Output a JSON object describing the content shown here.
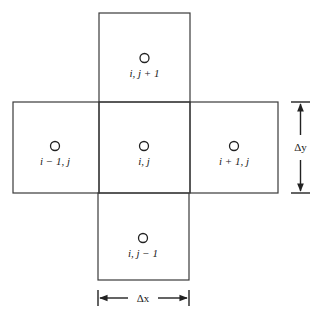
{
  "diagram": {
    "type": "five-point finite-difference stencil",
    "cells": [
      {
        "id": "north",
        "label": "i, j + 1"
      },
      {
        "id": "west",
        "label": "i − 1, j"
      },
      {
        "id": "center",
        "label": "i, j"
      },
      {
        "id": "east",
        "label": "i + 1, j"
      },
      {
        "id": "south",
        "label": "i, j − 1"
      }
    ],
    "dimensions": {
      "horizontal": "Δx",
      "vertical": "Δy"
    },
    "colors": {
      "stroke": "#3a3a3a",
      "background": "#ffffff"
    }
  }
}
